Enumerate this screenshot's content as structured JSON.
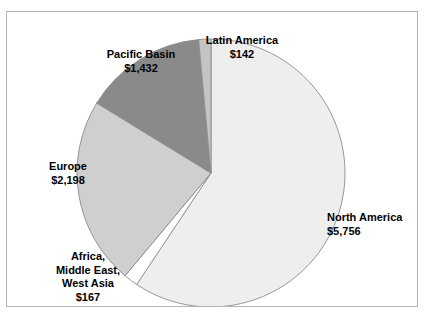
{
  "figure": {
    "frame_border_color": "#b4b4b4",
    "background_color": "#ffffff"
  },
  "chart_data": {
    "type": "pie",
    "title": "",
    "subtitle": "",
    "xlabel": "",
    "ylabel": "",
    "legend_position": "none",
    "grid": false,
    "value_prefix": "$",
    "start_angle_deg": 0,
    "direction": "clockwise",
    "total": 9695,
    "categories": [
      "North America",
      "Africa, Middle East, West Asia",
      "Europe",
      "Pacific Basin",
      "Latin America"
    ],
    "values": [
      5756,
      167,
      2198,
      1432,
      142
    ],
    "slices": [
      {
        "name": "North America",
        "label_lines": [
          "North America"
        ],
        "value": 5756,
        "value_label": "$5,756",
        "percent": 59.4,
        "angle_deg": 213.7,
        "start_deg": 0,
        "end_deg": 213.7,
        "color": "#eeeeee"
      },
      {
        "name": "Africa, Middle East, West Asia",
        "label_lines": [
          "Africa,",
          "Middle East,",
          "West Asia"
        ],
        "value": 167,
        "value_label": "$167",
        "percent": 1.7,
        "angle_deg": 6.2,
        "start_deg": 213.7,
        "end_deg": 219.9,
        "color": "#ffffff"
      },
      {
        "name": "Europe",
        "label_lines": [
          "Europe"
        ],
        "value": 2198,
        "value_label": "$2,198",
        "percent": 22.7,
        "angle_deg": 81.6,
        "start_deg": 219.9,
        "end_deg": 301.5,
        "color": "#cfcfcf"
      },
      {
        "name": "Pacific Basin",
        "label_lines": [
          "Pacific Basin"
        ],
        "value": 1432,
        "value_label": "$1,432",
        "percent": 14.8,
        "angle_deg": 53.2,
        "start_deg": 301.5,
        "end_deg": 354.7,
        "color": "#8a8a8a"
      },
      {
        "name": "Latin America",
        "label_lines": [
          "Latin America"
        ],
        "value": 142,
        "value_label": "$142",
        "percent": 1.5,
        "angle_deg": 5.3,
        "start_deg": 354.7,
        "end_deg": 360,
        "color": "#c4c4c4"
      }
    ]
  },
  "labels": {
    "north_america": {
      "name": "North America",
      "value": "$5,756"
    },
    "latin_america": {
      "name": "Latin America",
      "value": "$142"
    },
    "pacific_basin": {
      "name": "Pacific Basin",
      "value": "$1,432"
    },
    "europe": {
      "name": "Europe",
      "value": "$2,198"
    },
    "africa": {
      "line1": "Africa,",
      "line2": "Middle East,",
      "line3": "West Asia",
      "value": "$167"
    }
  }
}
